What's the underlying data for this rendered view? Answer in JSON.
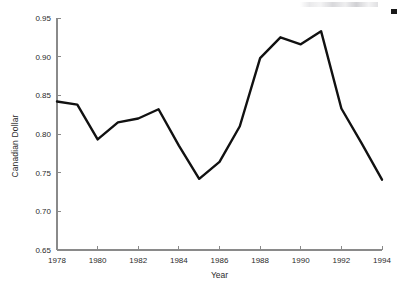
{
  "chart_data": {
    "type": "line",
    "title": "",
    "xlabel": "Year",
    "ylabel": "Canadian Dollar",
    "xlim": [
      1978,
      1994
    ],
    "ylim": [
      0.65,
      0.95
    ],
    "grid": false,
    "legend": null,
    "x": [
      1978,
      1979,
      1980,
      1981,
      1982,
      1983,
      1984,
      1985,
      1986,
      1987,
      1988,
      1989,
      1990,
      1991,
      1992,
      1993,
      1994
    ],
    "values": [
      0.842,
      0.838,
      0.793,
      0.815,
      0.82,
      0.832,
      0.785,
      0.742,
      0.764,
      0.81,
      0.898,
      0.925,
      0.916,
      0.933,
      0.833,
      0.788,
      0.741
    ],
    "series": [
      {
        "name": "Canadian Dollar",
        "color": "#111111",
        "values": [
          0.842,
          0.838,
          0.793,
          0.815,
          0.82,
          0.832,
          0.785,
          0.742,
          0.764,
          0.81,
          0.898,
          0.925,
          0.916,
          0.933,
          0.833,
          0.788,
          0.741
        ]
      }
    ],
    "xticks": [
      1978,
      1980,
      1982,
      1984,
      1986,
      1988,
      1990,
      1992,
      1994
    ],
    "xtick_labels": [
      "1978",
      "1980",
      "1982",
      "1984",
      "1986",
      "1988",
      "1990",
      "1992",
      "1994"
    ],
    "yticks": [
      0.65,
      0.7,
      0.75,
      0.8,
      0.85,
      0.9,
      0.95
    ],
    "ytick_labels": [
      "0.65",
      "0.70",
      "0.75",
      "0.80",
      "0.85",
      "0.90",
      "0.95"
    ],
    "axis_color": "#8a8a8a",
    "line_color": "#111111",
    "background": "#ffffff"
  },
  "axes": {
    "ylabel": "Canadian Dollar",
    "xlabel": "Year"
  }
}
